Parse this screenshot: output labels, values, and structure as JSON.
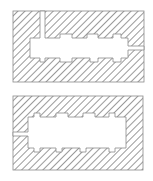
{
  "diagram": {
    "colors": {
      "background": "#ffffff",
      "hatch": "#6e6e6e",
      "outline": "#8a8a8a"
    },
    "figures": [
      {
        "name": "upper-section",
        "outer": {
          "x": 13,
          "y": 11,
          "w": 131,
          "h": 71
        },
        "cavity_path": "M40 11 L45 11 L45 38 L60 38 L60 34 L72 34 L72 38 L87 38 L87 34 L98 34 L98 38 L113 38 L113 34 L121 34 L121 38 L128 38 L128 46 L144 46 L144 50 L128 50 L128 58 L121 58 L121 62 L113 62 L113 58 L98 58 L98 62 L90 62 L90 58 L72 58 L72 62 L60 62 L60 58 L45 58 L45 62 L40 62 L40 58 L30 58 L30 38 L40 38 Z"
      },
      {
        "name": "lower-section",
        "outer": {
          "x": 13,
          "y": 96,
          "w": 130,
          "h": 74
        },
        "cavity_path": "M28 117 L34 117 L34 113 L40 113 L40 117 L56 117 L56 113 L68 113 L68 117 L83 117 L83 113 L95 113 L95 117 L109 117 L109 113 L115 113 L115 117 L126 117 L126 148 L115 148 L115 152 L109 152 L109 148 L86 148 L86 152 L80 152 L80 148 L62 148 L62 152 L56 152 L56 148 L40 148 L40 152 L34 152 L34 148 L28 148 L28 136 L13 136 L13 132 L28 132 Z"
      }
    ]
  }
}
